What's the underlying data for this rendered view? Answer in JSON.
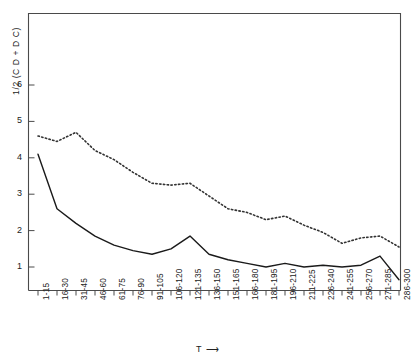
{
  "chart_data": {
    "type": "line",
    "title": "",
    "ylabel": "1/2 (C D + D C)",
    "xlabel": "T",
    "xlabel_arrow": "⟶",
    "grid": false,
    "legend": "none",
    "ylim": [
      0,
      7
    ],
    "yticks": [
      1,
      2,
      3,
      4,
      5,
      6
    ],
    "ytick_labels": [
      "1",
      "2",
      "3",
      "4",
      "5",
      "6"
    ],
    "categories": [
      "1-15",
      "16-30",
      "31-45",
      "46-60",
      "61-75",
      "76-90",
      "91-105",
      "106-120",
      "121-135",
      "136-150",
      "151-165",
      "166-180",
      "181-195",
      "196-210",
      "211-225",
      "226-240",
      "241-255",
      "256-270",
      "271-285",
      "286-300"
    ],
    "series": [
      {
        "name": "dotted-upper",
        "style": "dotted",
        "color": "#333333",
        "values": [
          4.6,
          4.45,
          4.7,
          4.2,
          3.95,
          3.6,
          3.3,
          3.25,
          3.3,
          2.95,
          2.6,
          2.5,
          2.3,
          2.4,
          2.15,
          1.95,
          1.65,
          1.8,
          1.85,
          1.55
        ]
      },
      {
        "name": "solid-lower",
        "style": "solid",
        "color": "#1a1a1a",
        "values": [
          4.1,
          2.6,
          2.2,
          1.85,
          1.6,
          1.45,
          1.35,
          1.5,
          1.85,
          1.35,
          1.2,
          1.1,
          1.0,
          1.1,
          1.0,
          1.05,
          1.0,
          1.05,
          1.3,
          0.65
        ]
      }
    ]
  },
  "axes": {
    "y_title": "1/2 (C D + D C)",
    "x_title": "T",
    "x_title_arrow": "⟶"
  }
}
